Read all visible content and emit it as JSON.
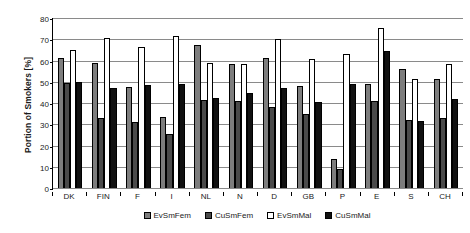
{
  "chart_data": {
    "type": "bar",
    "title": "",
    "xlabel": "",
    "ylabel": "Portion of Smokers [%]",
    "ylim": [
      0,
      80
    ],
    "ytick_step": 10,
    "yticks": [
      0,
      10,
      20,
      30,
      40,
      50,
      60,
      70,
      80
    ],
    "grid": true,
    "legend_position": "bottom",
    "categories": [
      "DK",
      "FIN",
      "F",
      "I",
      "NL",
      "N",
      "D",
      "GB",
      "P",
      "E",
      "S",
      "CH"
    ],
    "series": [
      {
        "name": "EvSmFem",
        "color": "#7d7d7d",
        "values": [
          61,
          59,
          47.5,
          33.5,
          67.5,
          58.5,
          61,
          48,
          13.5,
          49,
          56,
          51.5
        ]
      },
      {
        "name": "CuSmFem",
        "color": "#4a4a4a",
        "values": [
          49.5,
          33,
          31,
          25.5,
          41.5,
          41,
          38,
          35,
          9,
          41,
          32,
          33
        ]
      },
      {
        "name": "EvSmMal",
        "color": "#ffffff",
        "values": [
          65,
          70.5,
          66.5,
          71.5,
          59,
          58.5,
          70,
          60.5,
          63,
          75.5,
          51.5,
          58.5
        ]
      },
      {
        "name": "CuSmMal",
        "color": "#111111",
        "values": [
          50,
          47,
          48.5,
          49,
          42.5,
          44.5,
          47,
          40.5,
          49,
          64.5,
          31.5,
          42
        ]
      }
    ]
  },
  "axis": {
    "y_title": "Portion of Smokers [%]"
  },
  "legend": {
    "items": [
      {
        "label": "EvSmFem",
        "key": "s-evsmfem"
      },
      {
        "label": "CuSmFem",
        "key": "s-cusmfem"
      },
      {
        "label": "EvSmMal",
        "key": "s-evsmmal"
      },
      {
        "label": "CuSmMal",
        "key": "s-cusmmal"
      }
    ]
  }
}
